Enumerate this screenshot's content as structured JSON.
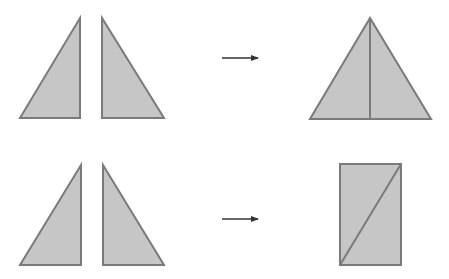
{
  "diagram": {
    "colors": {
      "fill": "#c6c6c6",
      "stroke": "#7a7a7a",
      "arrow": "#333333",
      "background": "#ffffff"
    },
    "rows": [
      {
        "name": "row-isosceles",
        "inputs": [
          {
            "name": "left-right-triangle",
            "points": "20,118 80,18 80,118"
          },
          {
            "name": "right-right-triangle",
            "points": "102,18 102,118 164,118"
          }
        ],
        "arrow": {
          "x1": 222,
          "y1": 58,
          "x2": 258,
          "y2": 58
        },
        "result": {
          "name": "isosceles-triangle",
          "shape": "triangle",
          "points": "370,18 310,119 431,119",
          "divider": {
            "x1": 370,
            "y1": 18,
            "x2": 370,
            "y2": 119
          }
        }
      },
      {
        "name": "row-rectangle",
        "inputs": [
          {
            "name": "left-right-triangle",
            "points": "20,265 81,165 81,265"
          },
          {
            "name": "right-right-triangle",
            "points": "103,165 103,265 164,265"
          }
        ],
        "arrow": {
          "x1": 222,
          "y1": 219,
          "x2": 258,
          "y2": 219
        },
        "result": {
          "name": "rectangle",
          "shape": "rectangle",
          "rect": {
            "x": 340,
            "y": 164,
            "width": 61,
            "height": 101
          },
          "divider": {
            "x1": 340,
            "y1": 265,
            "x2": 401,
            "y2": 164
          }
        }
      }
    ]
  }
}
